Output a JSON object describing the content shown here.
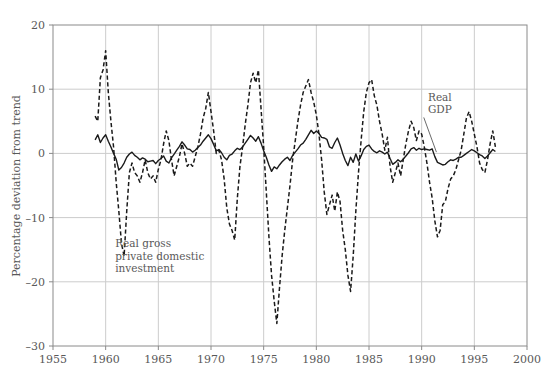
{
  "chart_data": {
    "type": "line",
    "title": "",
    "xlabel": "",
    "ylabel": "Percentage deviation from trend",
    "xlim": [
      1955,
      2000
    ],
    "ylim": [
      -30,
      20
    ],
    "xticks": [
      1955,
      1960,
      1965,
      1970,
      1975,
      1980,
      1985,
      1990,
      1995,
      2000
    ],
    "yticks": [
      20,
      10,
      0,
      -10,
      -20,
      -30
    ],
    "grid": true,
    "legend_position": "inline-annotations",
    "annotations": [
      {
        "name": "real-gdp-label",
        "text": "Real\nGDP",
        "lines": [
          "Real",
          "GDP"
        ],
        "x": 1990.6,
        "y": 8.2,
        "leader_from": [
          1990.2,
          5.6
        ],
        "leader_to": [
          1991.4,
          0.2
        ]
      },
      {
        "name": "investment-label",
        "text": "Real gross\nprivate domestic\ninvestment",
        "lines": [
          "Real gross",
          "private domestic",
          "investment"
        ],
        "x": 1960.9,
        "y": -14.6
      }
    ],
    "series": [
      {
        "name": "Real GDP",
        "style": "solid",
        "color": "#1a1a1a",
        "x": [
          1959.0,
          1959.25,
          1959.5,
          1959.75,
          1960.0,
          1960.25,
          1960.5,
          1960.75,
          1961.0,
          1961.25,
          1961.5,
          1961.75,
          1962.0,
          1962.25,
          1962.5,
          1962.75,
          1963.0,
          1963.25,
          1963.5,
          1963.75,
          1964.0,
          1964.25,
          1964.5,
          1964.75,
          1965.0,
          1965.25,
          1965.5,
          1965.75,
          1966.0,
          1966.25,
          1966.5,
          1966.75,
          1967.0,
          1967.25,
          1967.5,
          1967.75,
          1968.0,
          1968.25,
          1968.5,
          1968.75,
          1969.0,
          1969.25,
          1969.5,
          1969.75,
          1970.0,
          1970.25,
          1970.5,
          1970.75,
          1971.0,
          1971.25,
          1971.5,
          1971.75,
          1972.0,
          1972.25,
          1972.5,
          1972.75,
          1973.0,
          1973.25,
          1973.5,
          1973.75,
          1974.0,
          1974.25,
          1974.5,
          1974.75,
          1975.0,
          1975.25,
          1975.5,
          1975.75,
          1976.0,
          1976.25,
          1976.5,
          1976.75,
          1977.0,
          1977.25,
          1977.5,
          1977.75,
          1978.0,
          1978.25,
          1978.5,
          1978.75,
          1979.0,
          1979.25,
          1979.5,
          1979.75,
          1980.0,
          1980.25,
          1980.5,
          1980.75,
          1981.0,
          1981.25,
          1981.5,
          1981.75,
          1982.0,
          1982.25,
          1982.5,
          1982.75,
          1983.0,
          1983.25,
          1983.5,
          1983.75,
          1984.0,
          1984.25,
          1984.5,
          1984.75,
          1985.0,
          1985.25,
          1985.5,
          1985.75,
          1986.0,
          1986.25,
          1986.5,
          1986.75,
          1987.0,
          1987.25,
          1987.5,
          1987.75,
          1988.0,
          1988.25,
          1988.5,
          1988.75,
          1989.0,
          1989.25,
          1989.5,
          1989.75,
          1990.0,
          1990.25,
          1990.5,
          1990.75,
          1991.0,
          1991.25,
          1991.5,
          1991.75,
          1992.0,
          1992.25,
          1992.5,
          1992.75,
          1993.0,
          1993.25,
          1993.5,
          1993.75,
          1994.0,
          1994.25,
          1994.5,
          1994.75,
          1995.0,
          1995.25,
          1995.5,
          1995.75,
          1996.0,
          1996.25,
          1996.5,
          1996.75,
          1997.0
        ],
        "values": [
          2.1,
          2.9,
          1.7,
          2.4,
          2.9,
          1.9,
          1.0,
          0.0,
          -0.9,
          -2.6,
          -2.2,
          -1.5,
          -0.6,
          -0.1,
          0.2,
          -0.3,
          -0.6,
          -1.0,
          -0.7,
          -0.9,
          -1.3,
          -1.2,
          -1.1,
          -1.6,
          -1.1,
          -0.8,
          -0.4,
          -1.2,
          -1.5,
          -0.7,
          -0.1,
          0.5,
          1.1,
          1.8,
          1.3,
          0.7,
          0.6,
          0.2,
          0.5,
          0.9,
          1.3,
          1.9,
          2.4,
          2.9,
          2.3,
          1.4,
          0.4,
          0.6,
          0.1,
          -0.6,
          -1.0,
          -0.3,
          -0.1,
          0.4,
          0.8,
          0.6,
          1.0,
          1.6,
          2.2,
          2.8,
          2.4,
          1.9,
          2.6,
          1.6,
          0.4,
          -0.6,
          -1.8,
          -2.8,
          -2.1,
          -2.4,
          -1.8,
          -1.3,
          -0.9,
          -0.6,
          -1.1,
          -0.3,
          0.2,
          0.7,
          1.3,
          1.6,
          2.2,
          2.9,
          3.6,
          3.1,
          3.5,
          3.1,
          2.5,
          2.4,
          2.2,
          1.0,
          0.8,
          1.7,
          2.4,
          1.3,
          0.0,
          -1.1,
          -1.9,
          -0.6,
          -1.4,
          -0.1,
          -1.2,
          -0.4,
          0.6,
          1.1,
          1.3,
          0.7,
          0.3,
          0.1,
          0.4,
          0.2,
          -0.1,
          0.2,
          -0.8,
          -1.7,
          -1.4,
          -1.0,
          -1.3,
          -0.9,
          -0.4,
          0.1,
          0.7,
          0.9,
          0.5,
          0.8,
          0.6,
          0.7,
          0.6,
          0.5,
          0.7,
          -0.5,
          -1.4,
          -1.6,
          -1.8,
          -1.7,
          -1.3,
          -1.0,
          -1.1,
          -0.9,
          -0.6,
          -0.6,
          -0.3,
          0.0,
          0.3,
          0.6,
          0.4,
          0.1,
          -0.2,
          -0.4,
          -0.8,
          -0.4,
          0.1,
          0.6,
          0.3
        ]
      },
      {
        "name": "Real gross private domestic investment",
        "style": "dashed",
        "color": "#1a1a1a",
        "x": [
          1959.0,
          1959.25,
          1959.5,
          1959.75,
          1960.0,
          1960.25,
          1960.5,
          1960.75,
          1961.0,
          1961.25,
          1961.5,
          1961.75,
          1962.0,
          1962.25,
          1962.5,
          1962.75,
          1963.0,
          1963.25,
          1963.5,
          1963.75,
          1964.0,
          1964.25,
          1964.5,
          1964.75,
          1965.0,
          1965.25,
          1965.5,
          1965.75,
          1966.0,
          1966.25,
          1966.5,
          1966.75,
          1967.0,
          1967.25,
          1967.5,
          1967.75,
          1968.0,
          1968.25,
          1968.5,
          1968.75,
          1969.0,
          1969.25,
          1969.5,
          1969.75,
          1970.0,
          1970.25,
          1970.5,
          1970.75,
          1971.0,
          1971.25,
          1971.5,
          1971.75,
          1972.0,
          1972.25,
          1972.5,
          1972.75,
          1973.0,
          1973.25,
          1973.5,
          1973.75,
          1974.0,
          1974.25,
          1974.5,
          1974.75,
          1975.0,
          1975.25,
          1975.5,
          1975.75,
          1976.0,
          1976.25,
          1976.5,
          1976.75,
          1977.0,
          1977.25,
          1977.5,
          1977.75,
          1978.0,
          1978.25,
          1978.5,
          1978.75,
          1979.0,
          1979.25,
          1979.5,
          1979.75,
          1980.0,
          1980.25,
          1980.5,
          1980.75,
          1981.0,
          1981.25,
          1981.5,
          1981.75,
          1982.0,
          1982.25,
          1982.5,
          1982.75,
          1983.0,
          1983.25,
          1983.5,
          1983.75,
          1984.0,
          1984.25,
          1984.5,
          1984.75,
          1985.0,
          1985.25,
          1985.5,
          1985.75,
          1986.0,
          1986.25,
          1986.5,
          1986.75,
          1987.0,
          1987.25,
          1987.5,
          1987.75,
          1988.0,
          1988.25,
          1988.5,
          1988.75,
          1989.0,
          1989.25,
          1989.5,
          1989.75,
          1990.0,
          1990.25,
          1990.5,
          1990.75,
          1991.0,
          1991.25,
          1991.5,
          1991.75,
          1992.0,
          1992.25,
          1992.5,
          1992.75,
          1993.0,
          1993.25,
          1993.5,
          1993.75,
          1994.0,
          1994.25,
          1994.5,
          1994.75,
          1995.0,
          1995.25,
          1995.5,
          1995.75,
          1996.0,
          1996.25,
          1996.5,
          1996.75,
          1997.0
        ],
        "values": [
          5.8,
          5.0,
          11.8,
          13.0,
          16.0,
          9.5,
          5.0,
          1.0,
          -4.5,
          -9.0,
          -14.0,
          -16.0,
          -9.0,
          -3.0,
          -1.5,
          -3.0,
          -3.5,
          -4.5,
          -3.0,
          -1.0,
          -3.0,
          -4.0,
          -3.5,
          -4.5,
          -2.5,
          -1.0,
          1.5,
          3.5,
          2.0,
          -1.0,
          -3.5,
          -2.0,
          -0.5,
          1.5,
          0.0,
          -2.0,
          -1.5,
          -2.0,
          -0.5,
          1.0,
          3.0,
          5.5,
          7.0,
          9.5,
          6.5,
          3.5,
          0.0,
          0.5,
          -1.0,
          -4.0,
          -8.5,
          -11.0,
          -12.0,
          -13.5,
          -7.0,
          -2.0,
          1.0,
          4.5,
          7.5,
          11.0,
          12.5,
          11.0,
          13.0,
          7.0,
          1.0,
          -6.0,
          -13.0,
          -19.0,
          -23.0,
          -26.5,
          -21.0,
          -16.0,
          -12.0,
          -8.5,
          -5.0,
          -1.0,
          2.0,
          5.0,
          7.5,
          9.5,
          10.5,
          11.5,
          9.5,
          8.0,
          6.0,
          3.0,
          -1.0,
          -6.0,
          -9.5,
          -8.0,
          -6.5,
          -9.0,
          -6.0,
          -7.5,
          -12.0,
          -15.0,
          -19.0,
          -21.5,
          -16.0,
          -9.0,
          -3.0,
          2.0,
          6.5,
          9.5,
          11.0,
          11.5,
          9.0,
          7.5,
          5.0,
          3.0,
          0.5,
          2.5,
          -2.0,
          -4.5,
          -3.0,
          -1.5,
          -3.5,
          -1.0,
          1.5,
          3.5,
          5.0,
          4.0,
          2.0,
          3.5,
          3.0,
          1.0,
          -1.5,
          -4.5,
          -7.0,
          -10.5,
          -13.0,
          -12.0,
          -8.0,
          -7.5,
          -5.5,
          -4.0,
          -3.5,
          -2.5,
          -1.0,
          0.5,
          3.0,
          5.5,
          6.5,
          5.0,
          3.0,
          1.0,
          -1.5,
          -2.5,
          -3.0,
          -1.0,
          1.5,
          3.5,
          1.0
        ]
      }
    ]
  },
  "axis": {
    "y_title": "Percentage deviation from trend",
    "x_tick_labels": [
      "1955",
      "1960",
      "1965",
      "1970",
      "1975",
      "1980",
      "1985",
      "1990",
      "1995",
      "2000"
    ],
    "y_tick_labels": [
      "20",
      "10",
      "0",
      "–10",
      "–20",
      "–30"
    ]
  },
  "colors": {
    "axis": "#8a8a8a",
    "grid": "#cccccc",
    "line": "#1a1a1a",
    "text": "#595959",
    "background": "#ffffff"
  }
}
